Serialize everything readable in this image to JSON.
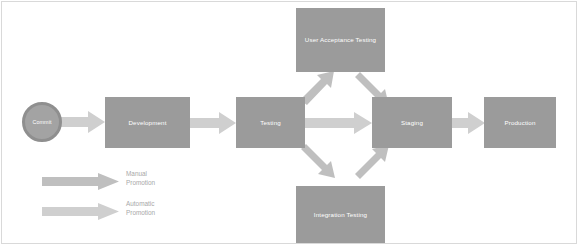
{
  "diagram": {
    "background_color": "#ffffff",
    "border_color": "#d9d9d9",
    "node_fill": "#9b9b9b",
    "node_text_color": "#ffffff",
    "arrow_manual_color": "#bfbfbf",
    "arrow_automatic_color": "#cfcfcf",
    "legend_text_color": "#a8a8a8",
    "start_node": {
      "label": "Commit",
      "shape": "circle"
    },
    "nodes": [
      {
        "id": "development",
        "label": "Development"
      },
      {
        "id": "testing",
        "label": "Testing"
      },
      {
        "id": "user_acceptance_testing",
        "label": "User Acceptance Testing"
      },
      {
        "id": "integration_testing",
        "label": "Integration Testing"
      },
      {
        "id": "staging",
        "label": "Staging"
      },
      {
        "id": "production",
        "label": "Production"
      }
    ],
    "edges": [
      {
        "from": "commit",
        "to": "development",
        "kind": "automatic"
      },
      {
        "from": "development",
        "to": "testing",
        "kind": "automatic"
      },
      {
        "from": "testing",
        "to": "user_acceptance_testing",
        "kind": "manual"
      },
      {
        "from": "testing",
        "to": "staging",
        "kind": "automatic"
      },
      {
        "from": "testing",
        "to": "integration_testing",
        "kind": "manual"
      },
      {
        "from": "user_acceptance_testing",
        "to": "staging",
        "kind": "manual"
      },
      {
        "from": "integration_testing",
        "to": "staging",
        "kind": "manual"
      },
      {
        "from": "staging",
        "to": "production",
        "kind": "automatic"
      }
    ],
    "legend": {
      "items": [
        {
          "id": "manual",
          "line1": "Manual",
          "line2": "Promotion"
        },
        {
          "id": "automatic",
          "line1": "Automatic",
          "line2": "Promotion"
        }
      ]
    }
  }
}
